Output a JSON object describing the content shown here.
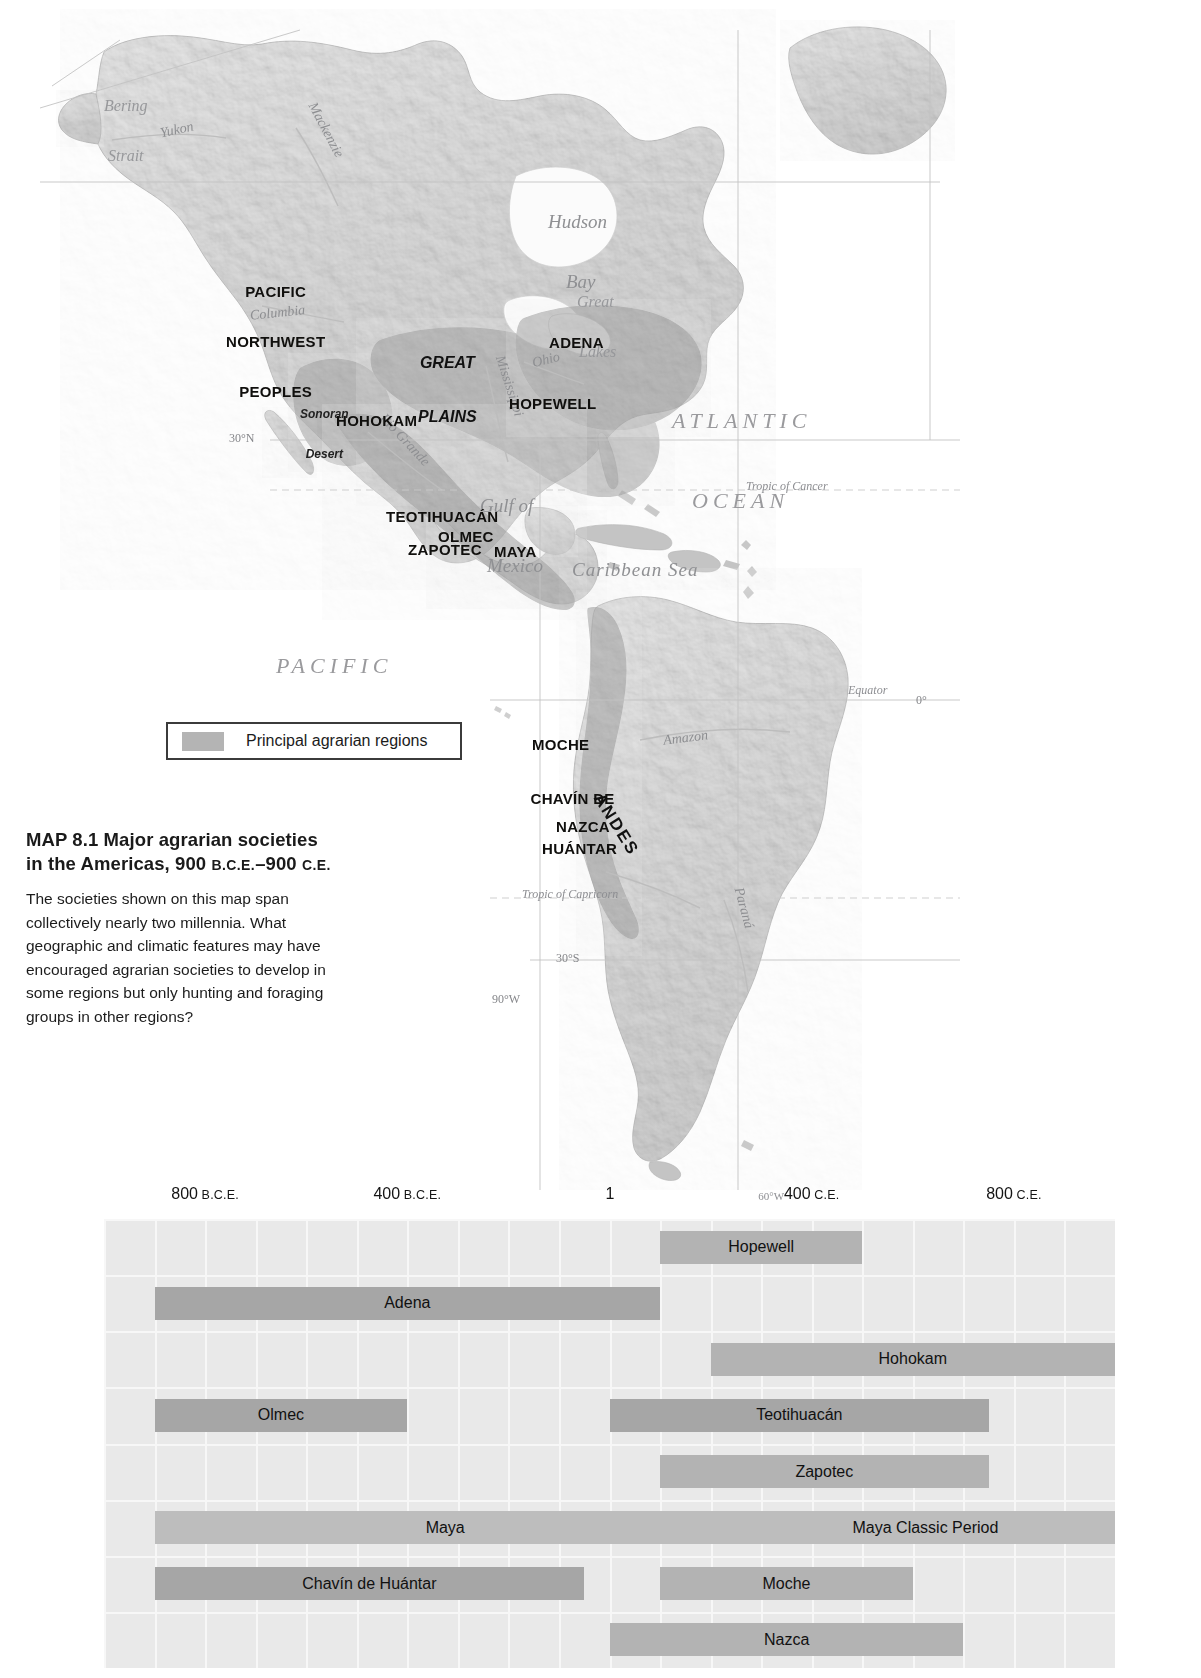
{
  "map": {
    "legend": {
      "label": "Principal agrarian regions",
      "swatch_color": "#b4b4b4"
    },
    "caption": {
      "map_number": "MAP 8.1",
      "title_part1": "Major agrarian societies in the Americas, 900",
      "era1": "B.C.E.",
      "dash": "–900",
      "era2": "C.E.",
      "body": "The societies shown on this map span collectively nearly two millennia. What geographic and climatic features may have encouraged agrarian societies to develop in some regions but only hunting and foraging groups in other regions?"
    },
    "societies": [
      {
        "name": "PACIFIC NORTHWEST PEOPLES",
        "line1": "PACIFIC",
        "line2": "NORTHWEST",
        "line3": "PEOPLES"
      },
      {
        "name": "HOHOKAM"
      },
      {
        "name": "ADENA"
      },
      {
        "name": "HOPEWELL"
      },
      {
        "name": "TEOTIHUACÁN"
      },
      {
        "name": "OLMEC"
      },
      {
        "name": "ZAPOTEC"
      },
      {
        "name": "MAYA"
      },
      {
        "name": "MOCHE"
      },
      {
        "name": "CHAVÍN DE HUÁNTAR",
        "line1": "CHAVÍN DE",
        "line2": "HUÁNTAR"
      },
      {
        "name": "NAZCA"
      }
    ],
    "oceans": [
      {
        "line1": "ATLANTIC",
        "line2": "OCEAN"
      },
      {
        "line1": "PACIFIC",
        "line2": "OCEAN"
      }
    ],
    "water_features": [
      {
        "label": "Hudson Bay",
        "line1": "Hudson",
        "line2": "Bay"
      },
      {
        "label": "Great Lakes",
        "line1": "Great",
        "line2": "Lakes"
      },
      {
        "label": "Gulf of Mexico",
        "line1": "Gulf of",
        "line2": "Mexico"
      },
      {
        "label": "Caribbean Sea"
      },
      {
        "label": "Bering Strait",
        "line1": "Bering",
        "line2": "Strait"
      }
    ],
    "rivers": [
      {
        "label": "Yukon"
      },
      {
        "label": "Mackenzie"
      },
      {
        "label": "Columbia"
      },
      {
        "label": "Rio Grande"
      },
      {
        "label": "Mississippi"
      },
      {
        "label": "Ohio"
      },
      {
        "label": "Amazon"
      },
      {
        "label": "Paraná"
      }
    ],
    "physiographic": [
      {
        "label": "GREAT PLAINS",
        "line1": "GREAT",
        "line2": "PLAINS"
      },
      {
        "label": "Sonoran Desert",
        "line1": "Sonoran",
        "line2": "Desert"
      },
      {
        "label": "ANDES"
      }
    ],
    "graticule": [
      {
        "label": "30°N"
      },
      {
        "label": "Tropic of Cancer"
      },
      {
        "label": "Equator"
      },
      {
        "label": "0°"
      },
      {
        "label": "Tropic of Capricorn"
      },
      {
        "label": "30°S"
      },
      {
        "label": "90°W"
      },
      {
        "label": "60°W"
      }
    ]
  },
  "chart_data": {
    "type": "bar",
    "orientation": "horizontal-timeline",
    "title": "Major agrarian societies in the Americas, 900 B.C.E.–900 C.E.",
    "xlabel": "",
    "ylabel": "",
    "xlim": [
      -1000,
      1000
    ],
    "axis_ticks": [
      {
        "value": -800,
        "label": "800",
        "era": "B.C.E."
      },
      {
        "value": -400,
        "label": "400",
        "era": "B.C.E."
      },
      {
        "value": 1,
        "label": "1",
        "era": ""
      },
      {
        "value": 400,
        "label": "400",
        "era": "C.E."
      },
      {
        "value": 800,
        "label": "800",
        "era": "C.E."
      }
    ],
    "map_reference_tick": "60°W",
    "grid": true,
    "series": [
      {
        "name": "Hopewell",
        "start": 100,
        "end": 500,
        "row": 0,
        "shade": "mid"
      },
      {
        "name": "Adena",
        "start": -900,
        "end": 100,
        "row": 1,
        "shade": "dark"
      },
      {
        "name": "Hohokam",
        "start": 200,
        "end": 1000,
        "row": 2,
        "shade": "mid"
      },
      {
        "name": "Olmec",
        "start": -900,
        "end": -400,
        "row": 3,
        "shade": "dark"
      },
      {
        "name": "Teotihuacán",
        "start": 1,
        "end": 750,
        "row": 3,
        "shade": "dark"
      },
      {
        "name": "Zapotec",
        "start": 100,
        "end": 750,
        "row": 4,
        "shade": "mid"
      },
      {
        "name": "Maya",
        "start": -900,
        "end": 250,
        "row": 5,
        "shade": "light"
      },
      {
        "name": "Maya Classic Period",
        "start": 250,
        "end": 1000,
        "row": 5,
        "shade": "light"
      },
      {
        "name": "Chavín de Huántar",
        "start": -900,
        "end": -50,
        "row": 6,
        "shade": "dark"
      },
      {
        "name": "Moche",
        "start": 100,
        "end": 600,
        "row": 6,
        "shade": "mid"
      },
      {
        "name": "Nazca",
        "start": 1,
        "end": 700,
        "row": 7,
        "shade": "mid"
      }
    ]
  }
}
